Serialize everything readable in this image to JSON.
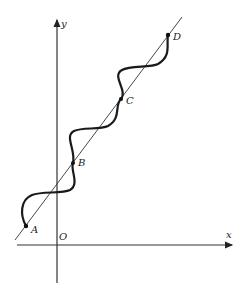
{
  "figure": {
    "axes": {
      "x_label": "x",
      "y_label": "y",
      "origin_label": "O"
    },
    "points": [
      {
        "label": "A",
        "x": 26,
        "y": 226
      },
      {
        "label": "B",
        "x": 73,
        "y": 163
      },
      {
        "label": "C",
        "x": 121,
        "y": 99
      },
      {
        "label": "D",
        "x": 168,
        "y": 35
      }
    ],
    "colors": {
      "stroke": "#222222",
      "background": "#ffffff"
    }
  }
}
